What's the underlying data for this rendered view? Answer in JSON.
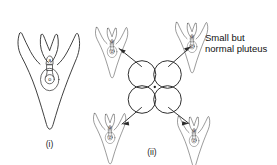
{
  "figure": {
    "name": "sea-urchin-pluteus-development-diagram",
    "background_color": "#ffffff",
    "ink_color": "#2b2b2b",
    "panels": [
      {
        "id": "panel-i",
        "caption": "(i)",
        "description": "normal-full-size-pluteus-larva"
      },
      {
        "id": "panel-ii",
        "caption": "(ii)",
        "description": "four-cell-embryo-separating-into-four-small-plutei"
      }
    ],
    "annotation": {
      "line_1": "Small but",
      "line_2": "normal pluteus"
    },
    "larvae": [
      {
        "id": "large-pluteus",
        "label_upper": "a",
        "label_lower": "o"
      },
      {
        "id": "small-pluteus-top-left",
        "label_upper": "a",
        "label_lower": "o"
      },
      {
        "id": "small-pluteus-top-right",
        "label_upper": "a",
        "label_lower": "o"
      },
      {
        "id": "small-pluteus-bottom-left",
        "label_upper": "a",
        "label_lower": "o"
      },
      {
        "id": "small-pluteus-bottom-right",
        "label_upper": "a",
        "label_lower": "o"
      }
    ],
    "embryo": {
      "id": "four-cell-embryo",
      "cell_count": 4,
      "arrow_count": 4
    }
  }
}
